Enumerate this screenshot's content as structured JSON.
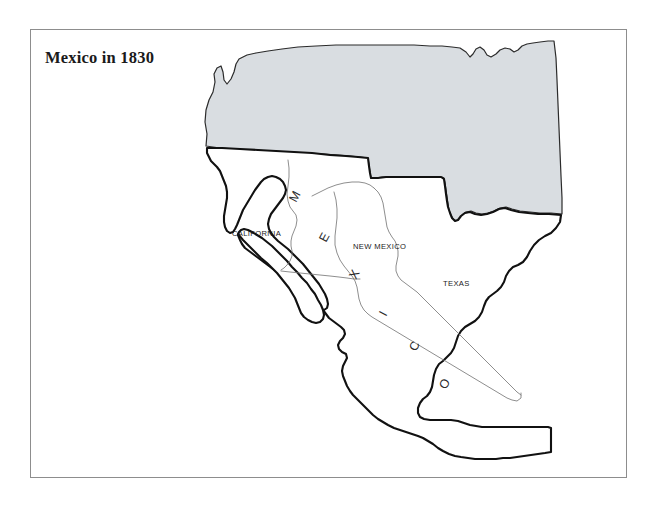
{
  "figure": {
    "title": "Mexico in 1830",
    "frame_color": "#8d8d8d",
    "background_color": "#ffffff"
  },
  "map": {
    "country_name_letters": [
      "M",
      "E",
      "X",
      "I",
      "C",
      "O"
    ],
    "country_name": "MEXICO",
    "regions": [
      {
        "name": "CALIFORNIA",
        "label": "CALIFORNIA",
        "fill": "#ffffff",
        "label_x": 232,
        "label_y": 236
      },
      {
        "name": "NEW MEXICO",
        "label": "NEW MEXICO",
        "fill": "#ffffff",
        "label_x": 353,
        "label_y": 249
      },
      {
        "name": "TEXAS",
        "label": "TEXAS",
        "fill": "#ffffff",
        "label_x": 443,
        "label_y": 286
      }
    ],
    "neighbor": {
      "name": "United States",
      "fill": "#d9dde1",
      "stroke": "#2b2b2b"
    },
    "mexico_outline_stroke": "#111111",
    "internal_border_stroke": "#7a7a7a"
  },
  "letters": [
    {
      "char": "M",
      "x": 296,
      "y": 203,
      "rotation": -62
    },
    {
      "char": "E",
      "x": 326,
      "y": 243,
      "rotation": -62
    },
    {
      "char": "X",
      "x": 356,
      "y": 280,
      "rotation": -62
    },
    {
      "char": "I",
      "x": 386,
      "y": 317,
      "rotation": -62
    },
    {
      "char": "C",
      "x": 416,
      "y": 352,
      "rotation": -62
    },
    {
      "char": "O",
      "x": 446,
      "y": 390,
      "rotation": -62
    }
  ]
}
